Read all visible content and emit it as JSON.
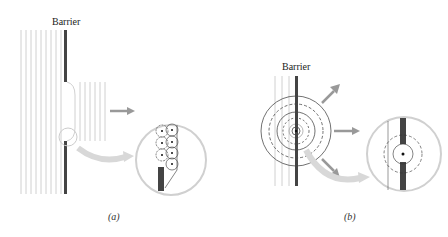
{
  "panel_a": {
    "barrier_label": "Barrier",
    "caption": "(a)",
    "colors": {
      "barrier": "#444444",
      "wavefront": "#bbbbbb",
      "arrow": "#999999",
      "magnifier": "#cccccc"
    }
  },
  "panel_b": {
    "barrier_label": "Barrier",
    "caption": "(b)",
    "colors": {
      "barrier": "#444444",
      "wavefront": "#bbbbbb",
      "circle": "#333333",
      "arrow": "#999999",
      "magnifier": "#cccccc"
    }
  }
}
